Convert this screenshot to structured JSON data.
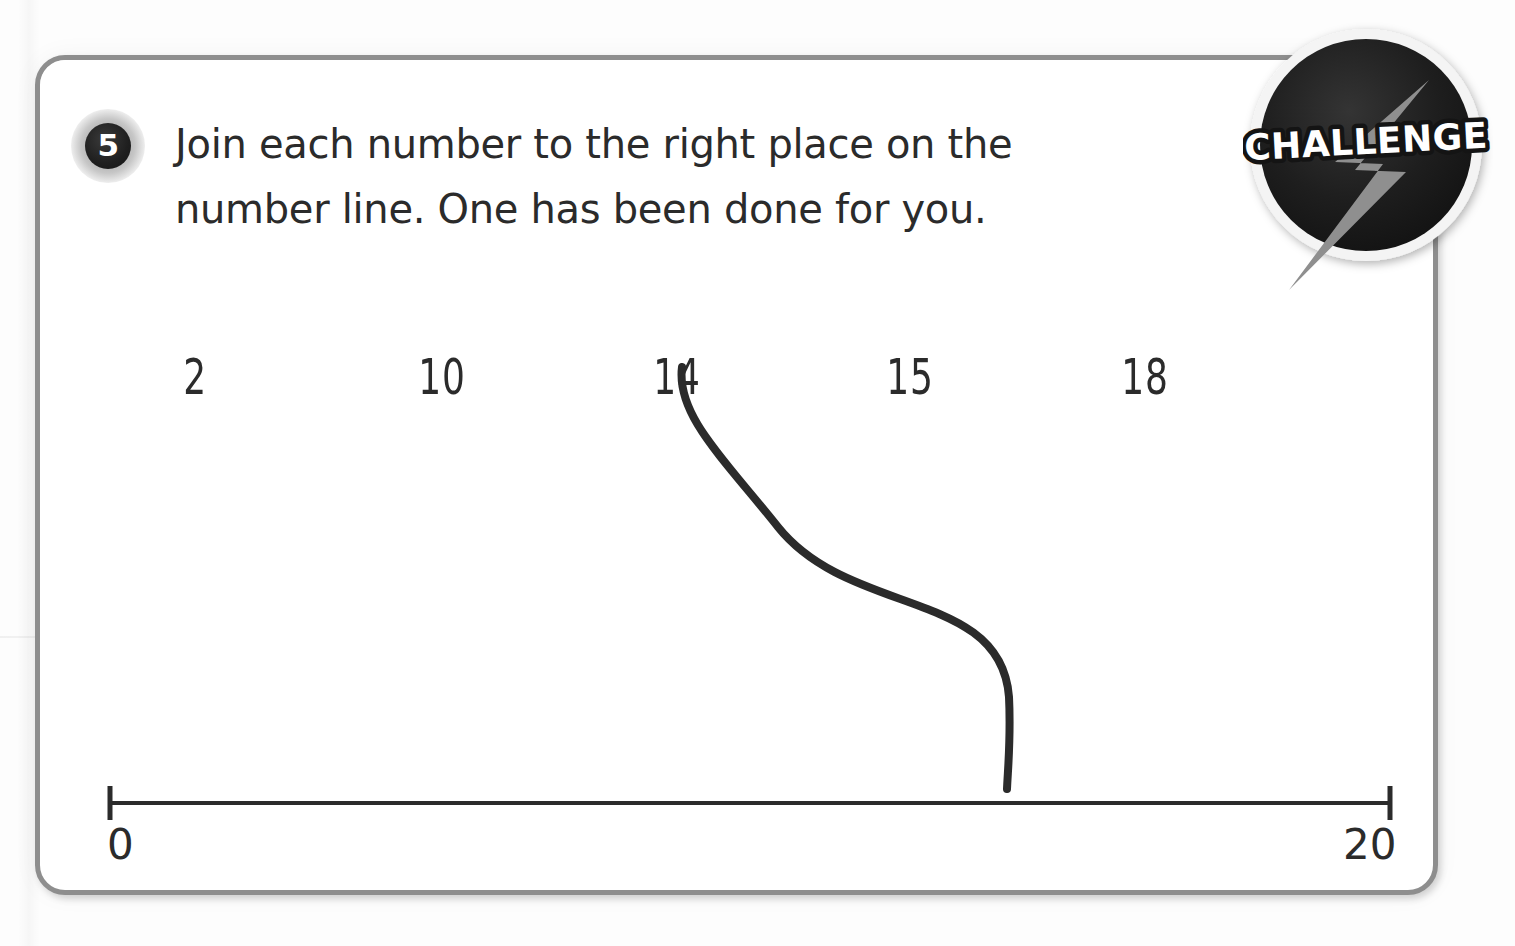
{
  "page": {
    "background_color": "#fdfdfd"
  },
  "card": {
    "border_color": "#8e8e8e",
    "background_color": "#ffffff"
  },
  "question": {
    "number": "5",
    "instruction_line_1": "Join each number to the right place on the",
    "instruction_line_2": "number line. One has been done for you.",
    "text_color": "#2b2b2b"
  },
  "challenge_badge": {
    "label": "CHALLENGE",
    "circle_color": "#1c1c1c",
    "bolt_color": "#8c8c8c",
    "text_color": "#ffffff",
    "ring_color": "#f2f2f2"
  },
  "numbers": [
    {
      "label": "2",
      "x": 190
    },
    {
      "label": "10",
      "x": 437
    },
    {
      "label": "14",
      "x": 672
    },
    {
      "label": "15",
      "x": 905
    },
    {
      "label": "18",
      "x": 1140
    }
  ],
  "number_line": {
    "start_label": "0",
    "end_label": "20",
    "min": 0,
    "max": 20,
    "line_color": "#2b2b2b",
    "left_x": 105,
    "right_x": 1385,
    "y": 798
  },
  "answer_curve": {
    "from_number": "14",
    "to_value": 14,
    "stroke_color": "#2b2b2b",
    "start_x": 677,
    "start_y": 362,
    "end_x": 1002,
    "end_y": 784
  },
  "chart_data": {
    "type": "line",
    "xlabel": "",
    "ylabel": "",
    "xlim": [
      0,
      20
    ],
    "grid": false,
    "legend": "none",
    "tick_labels": [
      "0",
      "20"
    ],
    "tick_values": [
      0,
      20
    ],
    "annotations": [
      {
        "text": "2",
        "matched": false,
        "value": null
      },
      {
        "text": "10",
        "matched": false,
        "value": null
      },
      {
        "text": "14",
        "matched": true,
        "value": 14
      },
      {
        "text": "15",
        "matched": false,
        "value": null
      },
      {
        "text": "18",
        "matched": false,
        "value": null
      }
    ]
  }
}
